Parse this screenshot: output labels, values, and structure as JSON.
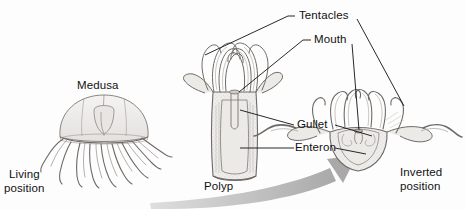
{
  "figure": {
    "background_color": "#fdfdfd",
    "ink_color": "#111111",
    "arrow_color": "#a8a8a8",
    "drawing_fill": "#efeeec",
    "drawing_stroke": "#6e6a66"
  },
  "labels": {
    "medusa": "Medusa",
    "living_position_line1": "Living",
    "living_position_line2": "position",
    "polyp": "Polyp",
    "tentacles": "Tentacles",
    "mouth": "Mouth",
    "gullet": "Gullet",
    "enteron": "Enteron",
    "inverted_position_line1": "Inverted",
    "inverted_position_line2": "position"
  },
  "organisms": [
    {
      "name": "medusa",
      "label": "Medusa",
      "position_label": "Living position",
      "orientation": "bell up, tentacles hanging down"
    },
    {
      "name": "polyp",
      "label": "Polyp",
      "orientation": "column up, tentacles at top",
      "parts": [
        "Tentacles",
        "Mouth",
        "Gullet",
        "Enteron"
      ]
    },
    {
      "name": "inverted-polyp",
      "label": "Inverted position",
      "orientation": "bell down, tentacles curving up",
      "parts": [
        "Tentacles",
        "Mouth",
        "Gullet",
        "Enteron"
      ]
    }
  ],
  "transform_arrow": {
    "description": "curved gray arrow from polyp to inverted position",
    "direction": "left to right, curving upward"
  }
}
